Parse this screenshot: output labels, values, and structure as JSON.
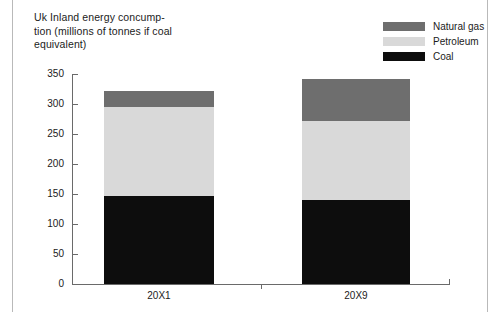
{
  "title": {
    "line1": "Uk Inland energy concump-",
    "line2": "tion (millions of tonnes if coal",
    "line3": "equivalent)"
  },
  "legend": {
    "items": [
      {
        "label": "Natural gas",
        "color": "#6e6e6e"
      },
      {
        "label": "Petroleum",
        "color": "#d9d9d9"
      },
      {
        "label": "Coal",
        "color": "#0d0d0d"
      }
    ]
  },
  "axis": {
    "y_ticks": [
      "350",
      "300",
      "250",
      "200",
      "150",
      "100",
      "50",
      "0"
    ],
    "x_labels": [
      "20X1",
      "20X9"
    ]
  },
  "chart_data": {
    "type": "bar",
    "stacked": true,
    "xlabel": "",
    "ylabel": "",
    "ylim": [
      0,
      350
    ],
    "ytick_step": 50,
    "grid": false,
    "legend_position": "top-right",
    "categories": [
      "20X1",
      "20X9"
    ],
    "series": [
      {
        "name": "Coal",
        "color": "#0d0d0d",
        "values": [
          147,
          140
        ]
      },
      {
        "name": "Petroleum",
        "color": "#d9d9d9",
        "values": [
          148,
          132
        ]
      },
      {
        "name": "Natural gas",
        "color": "#6e6e6e",
        "values": [
          27,
          69
        ]
      }
    ],
    "totals": [
      322,
      341
    ]
  }
}
